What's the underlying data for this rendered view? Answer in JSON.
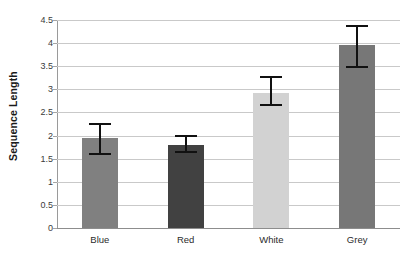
{
  "chart_data": {
    "type": "bar",
    "title": "",
    "subtitle": "",
    "xlabel": "",
    "ylabel": "Sequence Length",
    "categories": [
      "Blue",
      "Red",
      "White",
      "Grey"
    ],
    "values": [
      1.95,
      1.8,
      2.92,
      3.95
    ],
    "errors_low": [
      1.57,
      1.63,
      2.64,
      3.47
    ],
    "errors_high": [
      2.28,
      2.01,
      3.28,
      4.4
    ],
    "error_minus": [
      0.38,
      0.17,
      0.28,
      0.48
    ],
    "error_plus": [
      0.33,
      0.21,
      0.36,
      0.45
    ],
    "ylim": [
      0,
      4.5
    ],
    "ytick_step": 0.5,
    "ytick_labels": [
      "0",
      "0.5",
      "1",
      "1.5",
      "2",
      "2.5",
      "3",
      "3.5",
      "4",
      "4.5"
    ],
    "ytick_values": [
      0,
      0.5,
      1,
      1.5,
      2,
      2.5,
      3,
      3.5,
      4,
      4.5
    ],
    "grid": true,
    "grid_axis": "y",
    "legend": false,
    "legend_position": "none",
    "bar_colors": [
      "#808080",
      "#414141",
      "#d2d2d2",
      "#777777"
    ],
    "error_bar_color": "#111111",
    "gridline_color": "#c9c9c9",
    "axis_color": "#8d8d8d",
    "background_color": "#ffffff"
  }
}
